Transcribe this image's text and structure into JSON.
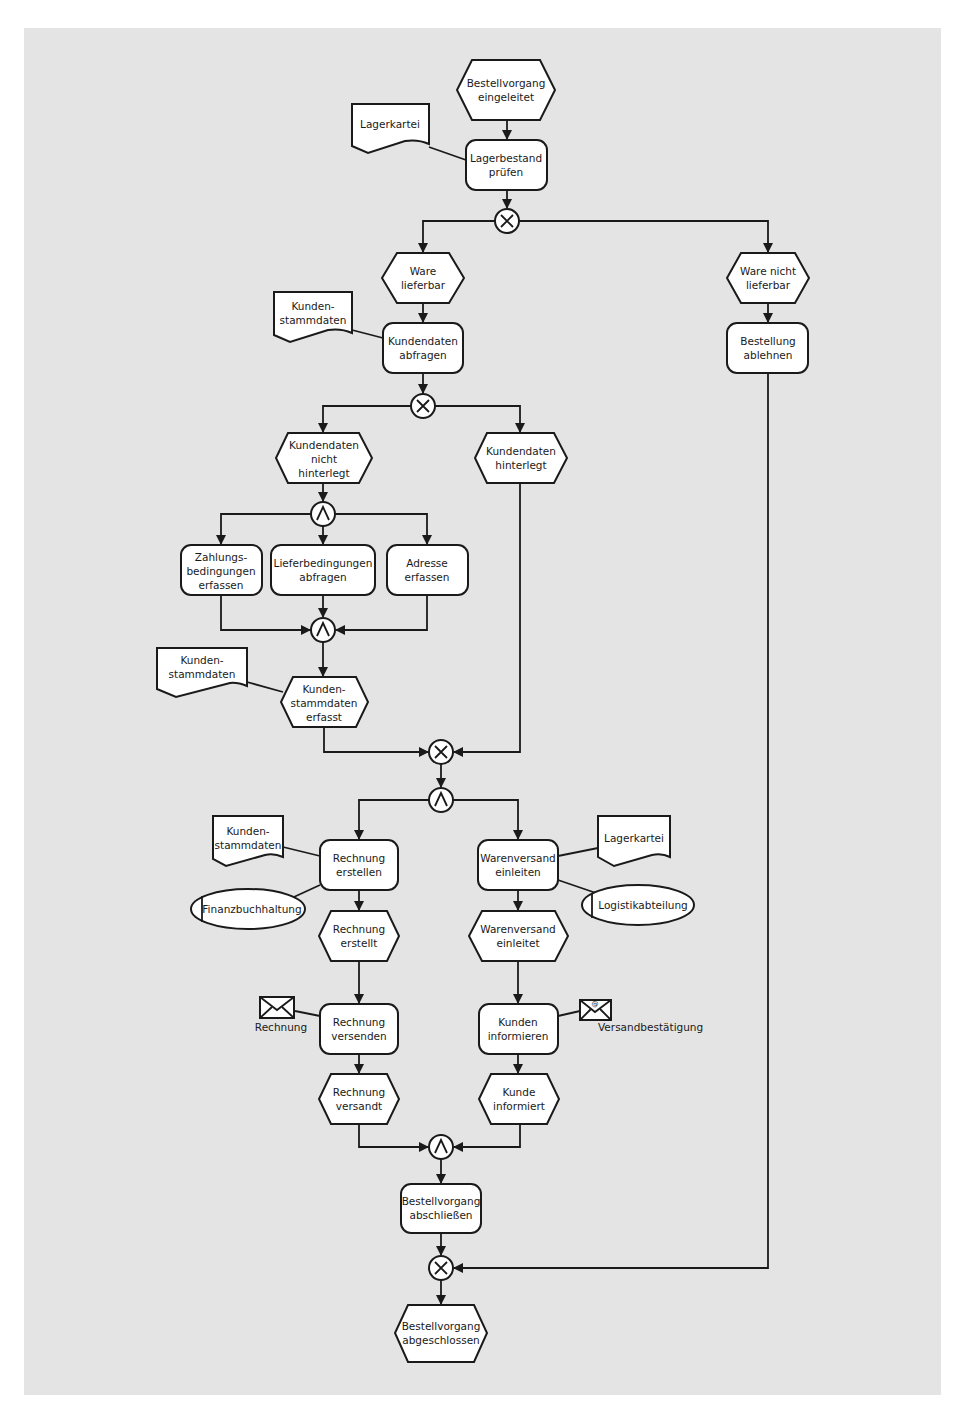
{
  "diagram": {
    "type": "EPK (event-driven process chain)",
    "background_color": "#e4e4e4",
    "line_color": "#1a1a1a",
    "shape_fill": "#ffffff",
    "events": {
      "e1": [
        "Bestellvorgang",
        "eingeleitet"
      ],
      "e2": [
        "Ware",
        "lieferbar"
      ],
      "e3": [
        "Ware nicht",
        "lieferbar"
      ],
      "e4": [
        "Kundendaten",
        "nicht",
        "hinterlegt"
      ],
      "e5": [
        "Kundendaten",
        "hinterlegt"
      ],
      "e6": [
        "Kunden-",
        "stammdaten",
        "erfasst"
      ],
      "e7": [
        "Rechnung",
        "erstellt"
      ],
      "e8": [
        "Warenversand",
        "einleitet"
      ],
      "e9": [
        "Rechnung",
        "versandt"
      ],
      "e10": [
        "Kunde",
        "informiert"
      ],
      "e11": [
        "Bestellvorgang",
        "abgeschlossen"
      ]
    },
    "functions": {
      "f1": [
        "Lagerbestand",
        "prüfen"
      ],
      "f2": [
        "Kundendaten",
        "abfragen"
      ],
      "f3": [
        "Bestellung",
        "ablehnen"
      ],
      "f4": [
        "Zahlungs-",
        "bedingungen",
        "erfassen"
      ],
      "f5": [
        "Lieferbedingungen",
        "abfragen"
      ],
      "f6": [
        "Adresse",
        "erfassen"
      ],
      "f7": [
        "Rechnung",
        "erstellen"
      ],
      "f8": [
        "Warenversand",
        "einleiten"
      ],
      "f9": [
        "Rechnung",
        "versenden"
      ],
      "f10": [
        "Kunden",
        "informieren"
      ],
      "f11": [
        "Bestellvorgang",
        "abschließen"
      ]
    },
    "documents": {
      "d1": [
        "Lagerkartei"
      ],
      "d2": [
        "Kunden-",
        "stammdaten"
      ],
      "d3": [
        "Kunden-",
        "stammdaten"
      ],
      "d4": [
        "Kunden-",
        "stammdaten"
      ],
      "d5": [
        "Lagerkartei"
      ]
    },
    "org_units": {
      "o1": "Finanzbuchhaltung",
      "o2": "Logistikabteilung"
    },
    "messages": {
      "m1": {
        "label": "Rechnung",
        "icon": "envelope-icon"
      },
      "m2": {
        "label": "Versandbestätigung",
        "icon": "email-envelope-icon"
      }
    },
    "connectors": {
      "c1": {
        "type": "XOR",
        "symbol": "✕"
      },
      "c2": {
        "type": "XOR",
        "symbol": "✕"
      },
      "c3": {
        "type": "AND",
        "symbol": "∧"
      },
      "c4": {
        "type": "AND",
        "symbol": "∧"
      },
      "c5": {
        "type": "XOR",
        "symbol": "✕"
      },
      "c6": {
        "type": "AND",
        "symbol": "∧"
      },
      "c7": {
        "type": "AND",
        "symbol": "∧"
      },
      "c8": {
        "type": "XOR",
        "symbol": "✕"
      }
    }
  }
}
